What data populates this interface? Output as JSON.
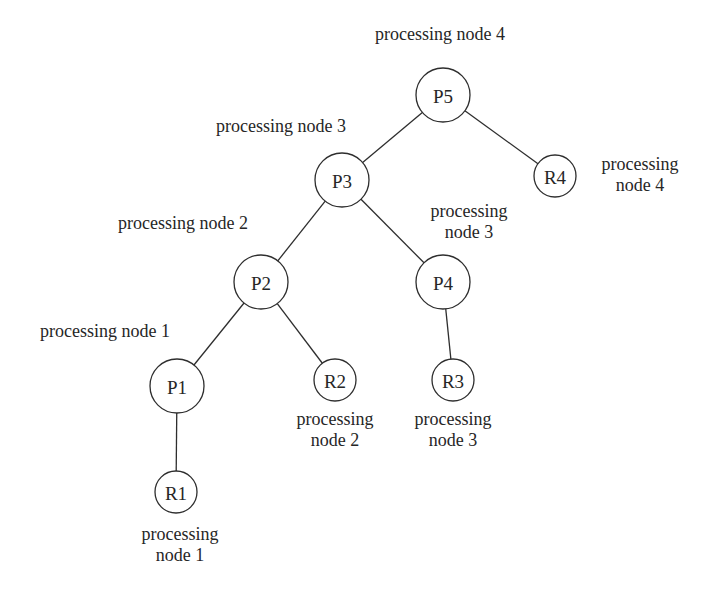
{
  "diagram": {
    "type": "tree",
    "style": {
      "line_color": "#2e2e2e",
      "text_color": "#262626",
      "background": "#ffffff"
    },
    "nodes": [
      {
        "id": "P5",
        "label": "P5",
        "kind": "P",
        "cx": 443,
        "cy": 95,
        "r": 27
      },
      {
        "id": "P3",
        "label": "P3",
        "kind": "P",
        "cx": 342,
        "cy": 180,
        "r": 27
      },
      {
        "id": "R4",
        "label": "R4",
        "kind": "R",
        "cx": 555,
        "cy": 176,
        "r": 21
      },
      {
        "id": "P2",
        "label": "P2",
        "kind": "P",
        "cx": 261,
        "cy": 282,
        "r": 27
      },
      {
        "id": "P4",
        "label": "P4",
        "kind": "P",
        "cx": 443,
        "cy": 282,
        "r": 27
      },
      {
        "id": "P1",
        "label": "P1",
        "kind": "P",
        "cx": 177,
        "cy": 386,
        "r": 27
      },
      {
        "id": "R2",
        "label": "R2",
        "kind": "R",
        "cx": 335,
        "cy": 380,
        "r": 21
      },
      {
        "id": "R3",
        "label": "R3",
        "kind": "R",
        "cx": 453,
        "cy": 380,
        "r": 21
      },
      {
        "id": "R1",
        "label": "R1",
        "kind": "R",
        "cx": 176,
        "cy": 492,
        "r": 21
      }
    ],
    "edges": [
      {
        "from": "P5",
        "to": "P3"
      },
      {
        "from": "P5",
        "to": "R4"
      },
      {
        "from": "P3",
        "to": "P2"
      },
      {
        "from": "P3",
        "to": "P4"
      },
      {
        "from": "P2",
        "to": "P1"
      },
      {
        "from": "P2",
        "to": "R2"
      },
      {
        "from": "P4",
        "to": "R3"
      },
      {
        "from": "P1",
        "to": "R1"
      }
    ],
    "annotations": [
      {
        "id": "ann-P5",
        "node": "P5",
        "lines": [
          "processing node 4"
        ],
        "x": 440,
        "y": 40,
        "anchor": "middle"
      },
      {
        "id": "ann-P3",
        "node": "P3",
        "lines": [
          "processing node 3"
        ],
        "x": 281,
        "y": 132,
        "anchor": "middle"
      },
      {
        "id": "ann-R4",
        "node": "R4",
        "lines": [
          "processing",
          "node 4"
        ],
        "x": 640,
        "y": 170,
        "anchor": "middle"
      },
      {
        "id": "ann-P4",
        "node": "P4",
        "lines": [
          "processing",
          "node 3"
        ],
        "x": 469,
        "y": 217,
        "anchor": "middle"
      },
      {
        "id": "ann-P2",
        "node": "P2",
        "lines": [
          "processing node 2"
        ],
        "x": 183,
        "y": 229,
        "anchor": "middle"
      },
      {
        "id": "ann-P1",
        "node": "P1",
        "lines": [
          "processing node 1"
        ],
        "x": 105,
        "y": 337,
        "anchor": "middle"
      },
      {
        "id": "ann-R2",
        "node": "R2",
        "lines": [
          "processing",
          "node 2"
        ],
        "x": 335,
        "y": 425,
        "anchor": "middle"
      },
      {
        "id": "ann-R3",
        "node": "R3",
        "lines": [
          "processing",
          "node 3"
        ],
        "x": 453,
        "y": 425,
        "anchor": "middle"
      },
      {
        "id": "ann-R1",
        "node": "R1",
        "lines": [
          "processing",
          "node 1"
        ],
        "x": 180,
        "y": 540,
        "anchor": "middle"
      }
    ],
    "line_height": 21
  }
}
